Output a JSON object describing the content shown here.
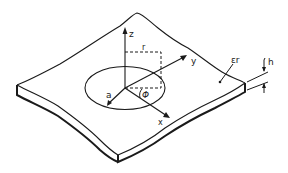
{
  "figure": {
    "colors": {
      "ink": "#1a1a1a",
      "background": "#ffffff"
    },
    "labels": {
      "z_axis": "z",
      "y_axis": "y",
      "x_axis": "x",
      "radius_r": "r",
      "patch_radius_a": "a",
      "angle_phi": "Φ",
      "permittivity": "εr",
      "thickness": "h"
    }
  }
}
